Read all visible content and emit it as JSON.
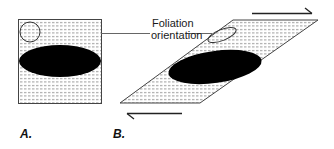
{
  "diagram": {
    "annotation": {
      "line1": "Foliation",
      "line2": "orientation"
    },
    "panels": [
      {
        "id": "A",
        "label": "A.",
        "shape": "square",
        "description": "undeformed square with circle and ellipse"
      },
      {
        "id": "B",
        "label": "B.",
        "shape": "parallelogram",
        "description": "sheared square with strain ellipse and elongated marker"
      }
    ],
    "shear_arrows": [
      {
        "position": "top",
        "direction": "right"
      },
      {
        "position": "bottom",
        "direction": "left"
      }
    ],
    "colors": {
      "stroke": "#333333",
      "fill_pattern_dot": "#8a8a8a",
      "ellipse_fill": "#000000",
      "background": "#ffffff"
    }
  }
}
